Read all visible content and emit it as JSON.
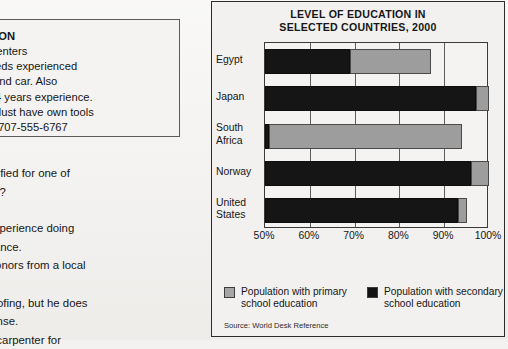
{
  "ad": {
    "heading": "STRUCTION",
    "lines": [
      "rs & Carpenters",
      "npany needs experienced",
      "wn tools and car. Also",
      "ices with 4 years experience.",
      "erience. Must have own tools",
      "ointment. 707-555-6767"
    ]
  },
  "question": {
    "line1_pre": " is best qualified for one of",
    "line2": "ed in the ad?",
    "answers": [
      "a year of experience doing",
      "rd maintenance.",
      "ated with honors from a local",
      "l.",
      "ne some roofing, but he does",
      "driver's license.",
      "orked as a carpenter for"
    ]
  },
  "chart_data": {
    "type": "bar",
    "orientation": "horizontal",
    "stacked": false,
    "title": "LEVEL OF EDUCATION IN SELECTED COUNTRIES, 2000",
    "title_lines": [
      "LEVEL OF EDUCATION IN",
      "SELECTED COUNTRIES, 2000"
    ],
    "categories": [
      "Egypt",
      "Japan",
      "South Africa",
      "Norway",
      "United States"
    ],
    "category_lines": [
      [
        "Egypt"
      ],
      [
        "Japan"
      ],
      [
        "South",
        "Africa"
      ],
      [
        "Norway"
      ],
      [
        "United",
        "States"
      ]
    ],
    "series": [
      {
        "name": "Population with primary school education",
        "name_lines": [
          "Population with primary",
          "school education"
        ],
        "color": "#9d9d9d",
        "values": [
          87,
          100,
          94,
          100,
          95
        ]
      },
      {
        "name": "Population with secondary school education",
        "name_lines": [
          "Population with secondary",
          "school education"
        ],
        "color": "#151515",
        "values": [
          69,
          97,
          51,
          96,
          93
        ]
      }
    ],
    "xlabel": "",
    "ylabel": "",
    "xlim": [
      50,
      100
    ],
    "xticks": [
      50,
      60,
      70,
      80,
      90,
      100
    ],
    "xtick_labels": [
      "50%",
      "60%",
      "70%",
      "80%",
      "90%",
      "100%"
    ],
    "grid": true,
    "legend_position": "bottom",
    "source": "Source: World Desk Reference"
  }
}
